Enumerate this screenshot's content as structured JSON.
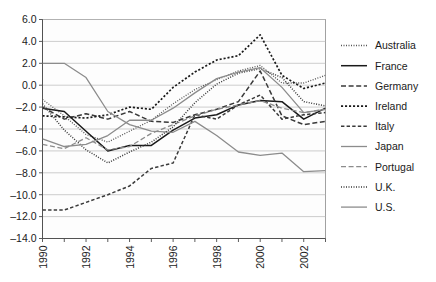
{
  "chart_data": {
    "type": "line",
    "title": "",
    "subtitle": "",
    "xlabel": "",
    "ylabel": "",
    "x": [
      1990,
      1991,
      1992,
      1993,
      1994,
      1995,
      1996,
      1997,
      1998,
      1999,
      2000,
      2001,
      2002,
      2003
    ],
    "xlim": [
      1990,
      2003
    ],
    "ylim": [
      -14.0,
      6.0
    ],
    "grid": true,
    "legend_position": "right",
    "ytick_labels": [
      "6.0",
      "4.0",
      "2.0",
      "0.0",
      "-2.0",
      "-4.0",
      "-6.0",
      "-8.0",
      "-10.0",
      "-12.0",
      "-14.0"
    ],
    "ytick_values": [
      6.0,
      4.0,
      2.0,
      0.0,
      -2.0,
      -4.0,
      -6.0,
      -8.0,
      -10.0,
      -12.0,
      -14.0
    ],
    "xtick_labels": [
      "1990",
      "1992",
      "1994",
      "1996",
      "1998",
      "2000",
      "2002"
    ],
    "xtick_values": [
      1990,
      1992,
      1994,
      1996,
      1998,
      2000,
      2002
    ],
    "series": [
      {
        "name": "Australia",
        "style": "dotted-fine",
        "color": "#555555",
        "values": [
          -1.3,
          -2.8,
          -4.5,
          -5.2,
          -4.2,
          -3.2,
          -1.7,
          -0.4,
          0.5,
          1.3,
          1.8,
          0.2,
          0.2,
          0.9
        ]
      },
      {
        "name": "France",
        "style": "solid",
        "color": "#1a1a1a",
        "values": [
          -2.1,
          -2.4,
          -4.2,
          -6.0,
          -5.5,
          -5.5,
          -4.1,
          -3.0,
          -2.7,
          -1.8,
          -1.4,
          -1.5,
          -3.1,
          -2.1
        ]
      },
      {
        "name": "Germany",
        "style": "dashed",
        "color": "#3a3a3a",
        "values": [
          -2.0,
          -3.1,
          -2.6,
          -3.1,
          -2.4,
          -3.3,
          -3.4,
          -2.7,
          -2.2,
          -1.5,
          1.3,
          -2.8,
          -3.6,
          -3.3
        ]
      },
      {
        "name": "Ireland",
        "style": "dotted-square",
        "color": "#1a1a1a",
        "values": [
          -2.8,
          -2.9,
          -3.0,
          -2.7,
          -2.0,
          -2.2,
          -0.2,
          1.2,
          2.3,
          2.7,
          4.6,
          0.9,
          -0.3,
          0.2
        ]
      },
      {
        "name": "Italy",
        "style": "dashed-med",
        "color": "#3a3a3a",
        "values": [
          -11.4,
          -11.4,
          -10.7,
          -10.0,
          -9.2,
          -7.6,
          -7.1,
          -2.7,
          -3.1,
          -1.8,
          -0.9,
          -3.1,
          -2.7,
          -2.5
        ]
      },
      {
        "name": "Japan",
        "style": "solid-gray",
        "color": "#8c8c8c",
        "values": [
          2.0,
          2.0,
          0.7,
          -2.4,
          -3.6,
          -4.2,
          -4.3,
          -3.3,
          -4.6,
          -6.1,
          -6.4,
          -6.2,
          -7.9,
          -7.8
        ]
      },
      {
        "name": "Portugal",
        "style": "dashed-gray",
        "color": "#8c8c8c",
        "values": [
          -5.4,
          -5.8,
          -4.8,
          -5.9,
          -5.6,
          -4.4,
          -3.6,
          -2.8,
          -2.2,
          -1.8,
          -1.4,
          -2.1,
          -2.5,
          -2.2
        ]
      },
      {
        "name": "U.K.",
        "style": "dotted-fine-dark",
        "color": "#3a3a3a",
        "values": [
          -1.7,
          -4.1,
          -5.9,
          -7.1,
          -6.1,
          -5.2,
          -3.8,
          -1.6,
          0.1,
          1.1,
          1.5,
          0.7,
          -1.5,
          -1.9
        ]
      },
      {
        "name": "U.S.",
        "style": "solid-gray2",
        "color": "#8c8c8c",
        "values": [
          -4.9,
          -5.6,
          -5.4,
          -4.6,
          -3.2,
          -3.2,
          -2.1,
          -0.7,
          0.6,
          1.2,
          1.6,
          -0.2,
          -2.5,
          -2.2
        ]
      }
    ]
  }
}
